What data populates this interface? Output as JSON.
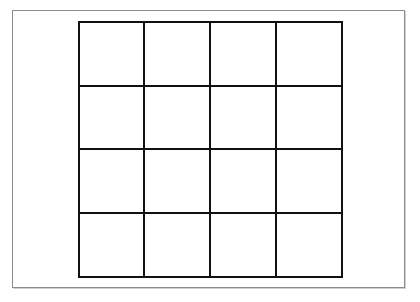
{
  "grid": {
    "rows": 4,
    "columns": 4,
    "line_color": "#111111",
    "frame_color": "#8c8c8c",
    "background": "#ffffff",
    "cells": [
      [
        "",
        "",
        "",
        ""
      ],
      [
        "",
        "",
        "",
        ""
      ],
      [
        "",
        "",
        "",
        ""
      ],
      [
        "",
        "",
        "",
        ""
      ]
    ]
  }
}
